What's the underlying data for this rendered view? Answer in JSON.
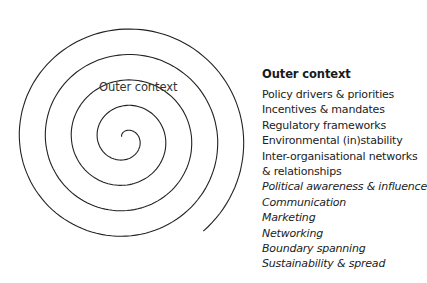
{
  "diagram": {
    "type": "spiral",
    "center_label": "Outer context",
    "stroke_color": "#222222"
  },
  "panel": {
    "title": "Outer context",
    "items": [
      {
        "text": "Policy drivers & priorities",
        "italic": false
      },
      {
        "text": "Incentives & mandates",
        "italic": false
      },
      {
        "text": "Regulatory frameworks",
        "italic": false
      },
      {
        "text": "Environmental (in)stability",
        "italic": false
      },
      {
        "text": "Inter-organisational networks",
        "italic": false
      },
      {
        "text": "& relationships",
        "italic": false
      },
      {
        "text": "Political awareness & influence",
        "italic": true
      },
      {
        "text": "Communication",
        "italic": true
      },
      {
        "text": "Marketing",
        "italic": true
      },
      {
        "text": "Networking",
        "italic": true
      },
      {
        "text": "Boundary spanning",
        "italic": true
      },
      {
        "text": "Sustainability & spread",
        "italic": true
      }
    ]
  }
}
